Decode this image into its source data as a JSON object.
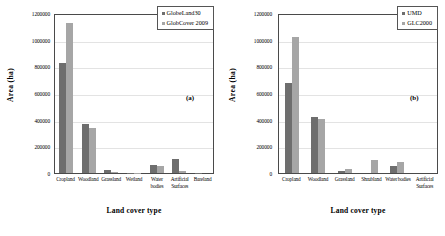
{
  "figure": {
    "panels": [
      {
        "tag": "(a)",
        "xlabel": "Land cover type",
        "ylabel": "Area (ha)"
      },
      {
        "tag": "(b)",
        "xlabel": "Land cover type",
        "ylabel": "Area (ha)"
      }
    ]
  },
  "colors": {
    "series_0": "#6e6e6e",
    "series_1": "#a6a6a6",
    "axis": "#4a4a4a",
    "grid": "#e3e3e3"
  },
  "chart_data": [
    {
      "type": "bar",
      "title": "",
      "panel_tag": "(a)",
      "xlabel": "Land cover type",
      "ylabel": "Area (ha)",
      "ylim": [
        0,
        1200000
      ],
      "yticks": [
        0,
        200000,
        400000,
        600000,
        800000,
        1000000,
        1200000
      ],
      "ytick_labels": [
        "0",
        "200000",
        "400000",
        "600000",
        "800000",
        "1000000",
        "1200000"
      ],
      "grid": true,
      "legend_position": "top-right",
      "categories": [
        "Cropland",
        "Woodland",
        "Grassland",
        "Wetland",
        "Water bodies",
        "Artificial Surfaces",
        "Bareland"
      ],
      "series": [
        {
          "name": "GlobeLand30",
          "values": [
            825000,
            365000,
            25000,
            3000,
            62000,
            108000,
            1000
          ]
        },
        {
          "name": "GlobCover 2009",
          "values": [
            1128000,
            338000,
            8000,
            1000,
            50000,
            12000,
            0
          ]
        }
      ]
    },
    {
      "type": "bar",
      "title": "",
      "panel_tag": "(b)",
      "xlabel": "Land cover type",
      "ylabel": "Area (ha)",
      "ylim": [
        0,
        1200000
      ],
      "yticks": [
        0,
        200000,
        400000,
        600000,
        800000,
        1000000,
        1200000
      ],
      "ytick_labels": [
        "0",
        "200000",
        "400000",
        "600000",
        "800000",
        "1000000",
        "1200000"
      ],
      "grid": true,
      "legend_position": "top-right",
      "categories": [
        "Cropland",
        "Woodland",
        "Grassland",
        "Shrubland",
        "Water bodies",
        "Artificial Surfaces"
      ],
      "series": [
        {
          "name": "UMD",
          "values": [
            675000,
            420000,
            12000,
            0,
            52000,
            0
          ]
        },
        {
          "name": "GLC2000",
          "values": [
            1018000,
            405000,
            33000,
            95000,
            82000,
            0
          ]
        }
      ]
    }
  ]
}
